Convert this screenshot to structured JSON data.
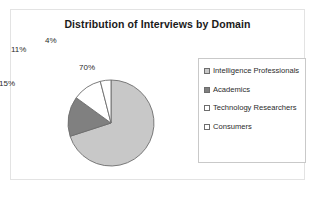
{
  "chart_data": {
    "type": "pie",
    "title": "Distribution of Interviews by Domain",
    "categories": [
      "Intelligence Professionals",
      "Academics",
      "Technology Researchers",
      "Consumers"
    ],
    "values": [
      70,
      15,
      11,
      4
    ],
    "data_labels": [
      "70%",
      "15%",
      "11%",
      "4%"
    ],
    "colors": [
      "#c8c8c8",
      "#808080",
      "#ffffff",
      "#ffffff"
    ],
    "slice_border_color": "#6d6d6d",
    "legend_position": "right",
    "grid": false,
    "xlabel": "",
    "ylabel": ""
  },
  "legend": {
    "items": [
      {
        "label": "Intelligence Professionals",
        "swatch": "#c8c8c8",
        "icon": "legend-swatch-icon"
      },
      {
        "label": "Academics",
        "swatch": "#808080",
        "icon": "legend-swatch-icon"
      },
      {
        "label": "Technology Researchers",
        "swatch": "#ffffff",
        "icon": "legend-swatch-icon"
      },
      {
        "label": "Consumers",
        "swatch": "#ffffff",
        "icon": "legend-swatch-icon"
      }
    ]
  }
}
